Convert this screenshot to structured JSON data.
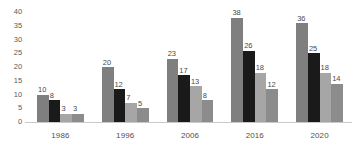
{
  "chart_data": {
    "type": "bar",
    "title": "",
    "subtitle": "",
    "xlabel": "",
    "ylabel": "",
    "categories": [
      "1986",
      "1996",
      "2006",
      "2016",
      "2020"
    ],
    "series": [
      {
        "name": "series-1",
        "color": "#7f7f7f",
        "values": [
          10,
          20,
          23,
          38,
          36
        ]
      },
      {
        "name": "series-2",
        "color": "#1a1a1a",
        "values": [
          8,
          12,
          17,
          26,
          25
        ]
      },
      {
        "name": "series-3",
        "color": "#a6a6a6",
        "values": [
          3,
          7,
          13,
          18,
          18
        ]
      },
      {
        "name": "series-4",
        "color": "#8c8c8c",
        "values": [
          3,
          5,
          8,
          12,
          14
        ]
      }
    ],
    "ylim": [
      0,
      40
    ],
    "yticks": [
      "0",
      "5",
      "10",
      "15",
      "20",
      "25",
      "30",
      "35",
      "40"
    ],
    "ytick_values": [
      0,
      5,
      10,
      15,
      20,
      25,
      30,
      35,
      40
    ],
    "grid": false,
    "legend": "none",
    "data_labels": true,
    "axis_color": "#c9c9c9",
    "background": "#ffffff",
    "text_color": "#4f4f4f"
  }
}
